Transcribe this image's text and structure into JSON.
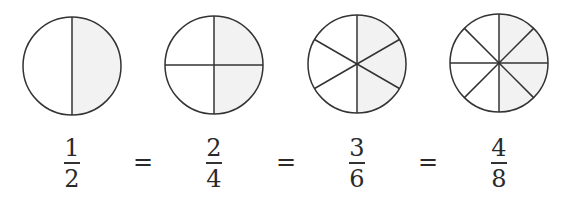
{
  "diagram": {
    "shade_color": "#f2f2f2",
    "stroke_color": "#333333",
    "fractions": [
      {
        "numerator": "1",
        "denominator": "2",
        "parts": 2,
        "shaded": 1
      },
      {
        "numerator": "2",
        "denominator": "4",
        "parts": 4,
        "shaded": 2
      },
      {
        "numerator": "3",
        "denominator": "6",
        "parts": 6,
        "shaded": 3
      },
      {
        "numerator": "4",
        "denominator": "8",
        "parts": 8,
        "shaded": 4
      }
    ],
    "equals": [
      "=",
      "=",
      "="
    ]
  }
}
